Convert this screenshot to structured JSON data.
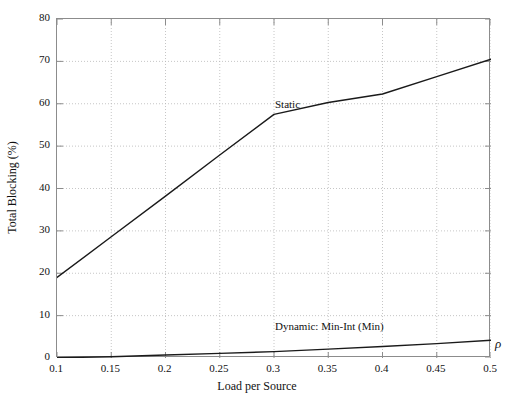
{
  "chart_data": {
    "type": "line",
    "title": "",
    "xlabel": "Load per Source",
    "ylabel": "Total Blocking (%)",
    "x_axis_symbol": "ρ",
    "xlim": [
      0.1,
      0.5
    ],
    "ylim": [
      0,
      80
    ],
    "xticks": [
      0.1,
      0.15,
      0.2,
      0.25,
      0.3,
      0.35,
      0.4,
      0.45,
      0.5
    ],
    "xtick_labels": [
      "0.1",
      "0.15",
      "0.2",
      "0.25",
      "0.3",
      "0.35",
      "0.4",
      "0.45",
      "0.5"
    ],
    "yticks": [
      0,
      10,
      20,
      30,
      40,
      50,
      60,
      70,
      80
    ],
    "ytick_labels": [
      "0",
      "10",
      "20",
      "30",
      "40",
      "50",
      "60",
      "70",
      "80"
    ],
    "grid": true,
    "grid_style": "dotted",
    "legend_position": "inline-annotations",
    "x": [
      0.1,
      0.15,
      0.2,
      0.25,
      0.3,
      0.35,
      0.4,
      0.45,
      0.5
    ],
    "series": [
      {
        "name": "Static",
        "label": "Static",
        "color": "#1a1a1a",
        "values": [
          19.0,
          28.6,
          38.2,
          47.9,
          57.5,
          60.3,
          62.3,
          66.4,
          70.5
        ],
        "annotation": {
          "text": "Static",
          "x": 0.3,
          "y": 59.5
        }
      },
      {
        "name": "Dynamic: Min-Int (Min)",
        "label": "Dynamic: Min-Int (Min)",
        "color": "#1a1a1a",
        "values": [
          0.05,
          0.3,
          0.7,
          1.1,
          1.5,
          2.1,
          2.7,
          3.4,
          4.2
        ],
        "annotation": {
          "text": "Dynamic: Min-Int (Min)",
          "x": 0.3,
          "y": 7.0
        }
      }
    ],
    "colors": {
      "axis": "#8c8c8c",
      "grid": "#b8b8b8",
      "line": "#1a1a1a",
      "text": "#111111",
      "background": "#ffffff"
    }
  }
}
